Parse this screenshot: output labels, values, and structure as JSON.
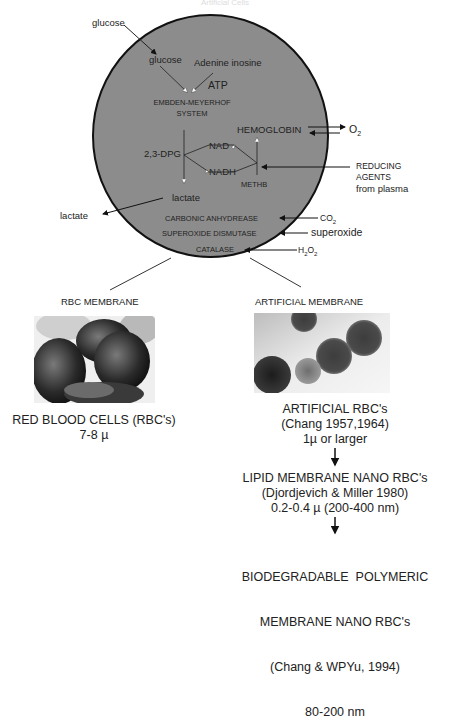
{
  "header": {
    "faint_title": "Artificial Cells"
  },
  "cell": {
    "fill_color": "#8c8c8c",
    "outline_color": "#111111",
    "outside": {
      "glucose_in": "glucose",
      "lactate_out": "lactate",
      "o2": "O",
      "o2_sub": "2",
      "reducing_agents": [
        "REDUCING",
        "AGENTS",
        "from plasma"
      ],
      "co2": "CO",
      "co2_sub": "2",
      "superoxide": "superoxide",
      "h2o2_h": "H",
      "h2o2_sub1": "2",
      "h2o2_o": "O",
      "h2o2_sub2": "2"
    },
    "inside": {
      "glucose": "glucose",
      "adenine_inosine": "Adenine inosine",
      "atp": "ATP",
      "embden_meyerhof": [
        "EMBDEN-MEYERHOF",
        "SYSTEM"
      ],
      "dpg": "2,3-DPG",
      "nad": "NAD",
      "nadh": "NADH",
      "hemoglobin": "HEMOGLOBIN",
      "methb": "METHB",
      "lactate": "lactate",
      "carbonic_anhydrease": "CARBONIC ANHYDREASE",
      "superoxide_dismutase": "SUPEROXIDE DISMUTASE",
      "catalase": "CATALASE"
    }
  },
  "left_branch": {
    "membrane_label": "RBC MEMBRANE",
    "image_alt": "red blood cells micrograph",
    "title": "RED BLOOD CELLS (RBC's)",
    "size": "7-8 µ"
  },
  "right_branch": {
    "membrane_label": "ARTIFICIAL MEMBRANE",
    "image_alt": "artificial RBC micrograph",
    "stages": [
      {
        "lines": [
          "ARTIFICIAL RBC's",
          "(Chang 1957,1964)",
          "1µ or larger"
        ]
      },
      {
        "lines": [
          "LIPID MEMBRANE NANO RBC's",
          "(Djordjevich & Miller 1980)",
          "0.2-0.4 µ (200-400 nm)"
        ]
      },
      {
        "lines": [
          "BIODEGRADABLE  POLYMERIC",
          "MEMBRANE NANO RBC's",
          "(Chang & WPYu, 1994)",
          "80-200 nm"
        ]
      }
    ]
  }
}
